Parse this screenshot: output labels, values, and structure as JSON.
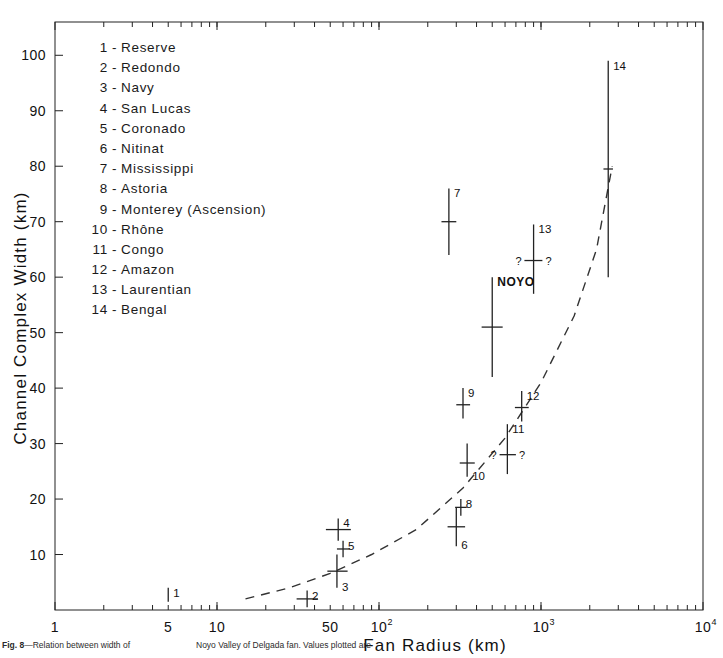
{
  "chart_data": {
    "type": "scatter",
    "xlabel": "Fan  Radius  (km)",
    "ylabel": "Channel  Complex  Width (km)",
    "xscale": "log",
    "yscale": "linear",
    "xlim": [
      1,
      10000
    ],
    "ylim": [
      0,
      106
    ],
    "grid": false,
    "legend_position": "upper-left-inside",
    "xticks_labeled": [
      {
        "value": 1,
        "label": "1"
      },
      {
        "value": 5,
        "label": "5"
      },
      {
        "value": 10,
        "label": "10"
      },
      {
        "value": 50,
        "label": "50"
      },
      {
        "value": 100,
        "label": "10",
        "sup": "2"
      },
      {
        "value": 1000,
        "label": "10",
        "sup": "3"
      },
      {
        "value": 10000,
        "label": "10",
        "sup": "4"
      }
    ],
    "yticks_labeled": [
      10,
      20,
      30,
      40,
      50,
      60,
      70,
      80,
      90,
      100
    ],
    "points": [
      {
        "id": "1",
        "name": "Reserve",
        "x": 5,
        "y": 1.5,
        "ylow": 1.5,
        "yhigh": 4.0,
        "xlow": 5,
        "xhigh": 5,
        "label": "1",
        "label_pos": "top"
      },
      {
        "id": "2",
        "name": "Redondo",
        "x": 36,
        "y": 2.0,
        "ylow": 0.5,
        "yhigh": 3.5,
        "xlow": 31,
        "xhigh": 42,
        "label": "2",
        "label_pos": "top-right"
      },
      {
        "id": "3",
        "name": "Navy",
        "x": 55,
        "y": 7.0,
        "ylow": 4.0,
        "yhigh": 10.0,
        "xlow": 48,
        "xhigh": 64,
        "label": "3",
        "label_pos": "bottom-right"
      },
      {
        "id": "4",
        "name": "San Lucas",
        "x": 56,
        "y": 14.5,
        "ylow": 12.5,
        "yhigh": 16.5,
        "xlow": 47,
        "xhigh": 67,
        "label": "4",
        "label_pos": "top-right"
      },
      {
        "id": "5",
        "name": "Coronado",
        "x": 60,
        "y": 11.0,
        "ylow": 9.5,
        "yhigh": 12.5,
        "xlow": 55,
        "xhigh": 66,
        "label": "5",
        "label_pos": "top-right"
      },
      {
        "id": "6",
        "name": "Nitinat",
        "x": 300,
        "y": 15.0,
        "ylow": 11.5,
        "yhigh": 18.5,
        "xlow": 265,
        "xhigh": 340,
        "label": "6",
        "label_pos": "bottom-right"
      },
      {
        "id": "7",
        "name": "Mississippi",
        "x": 270,
        "y": 70.0,
        "ylow": 64.0,
        "yhigh": 76.0,
        "xlow": 243,
        "xhigh": 300,
        "label": "7",
        "label_pos": "top-right"
      },
      {
        "id": "8",
        "name": "Astoria",
        "x": 320,
        "y": 18.5,
        "ylow": 17.0,
        "yhigh": 20.0,
        "xlow": 295,
        "xhigh": 348,
        "label": "8",
        "label_pos": "top-right"
      },
      {
        "id": "9",
        "name": "Monterey (Ascension)",
        "x": 330,
        "y": 37.0,
        "ylow": 34.5,
        "yhigh": 40.0,
        "xlow": 300,
        "xhigh": 365,
        "label": "9",
        "label_pos": "top-right"
      },
      {
        "id": "10",
        "name": "Rhône",
        "x": 350,
        "y": 26.5,
        "ylow": 24.0,
        "yhigh": 30.0,
        "xlow": 315,
        "xhigh": 390,
        "label": "10",
        "label_pos": "bottom-right"
      },
      {
        "id": "11",
        "name": "Congo",
        "x": 620,
        "y": 28.0,
        "ylow": 24.5,
        "yhigh": 33.5,
        "xlow": 555,
        "xhigh": 700,
        "label": "11",
        "label_pos": "top-right",
        "xquery": true
      },
      {
        "id": "12",
        "name": "Amazon",
        "x": 760,
        "y": 36.5,
        "ylow": 34.0,
        "yhigh": 39.5,
        "xlow": 690,
        "xhigh": 840,
        "label": "12",
        "label_pos": "top-right"
      },
      {
        "id": "13",
        "name": "Laurentian",
        "x": 900,
        "y": 63.0,
        "ylow": 57.0,
        "yhigh": 69.5,
        "xlow": 790,
        "xhigh": 1020,
        "label": "13",
        "label_pos": "top-right",
        "xquery": true
      },
      {
        "id": "14",
        "name": "Bengal",
        "x": 2600,
        "y": 79.5,
        "ylow": 60.0,
        "yhigh": 99.0,
        "xlow": 2430,
        "xhigh": 2780,
        "label": "14",
        "label_pos": "top-right"
      }
    ],
    "special_points": [
      {
        "id": "NOYO",
        "name": "NOYO",
        "x": 500,
        "y": 51.0,
        "ylow": 42.0,
        "yhigh": 60.0,
        "xlow": 430,
        "xhigh": 580,
        "label": "NOYO",
        "label_pos": "top-right"
      }
    ],
    "trend_line": {
      "style": "dashed",
      "description": "dashed best-fit curve rising from lower-left to upper-right",
      "points": [
        {
          "x": 15,
          "y": 2.0
        },
        {
          "x": 28,
          "y": 4.0
        },
        {
          "x": 50,
          "y": 6.6
        },
        {
          "x": 90,
          "y": 10.0
        },
        {
          "x": 170,
          "y": 14.5
        },
        {
          "x": 330,
          "y": 22.0
        },
        {
          "x": 600,
          "y": 31.0
        },
        {
          "x": 1000,
          "y": 41.0
        },
        {
          "x": 1600,
          "y": 53.0
        },
        {
          "x": 2200,
          "y": 65.0
        },
        {
          "x": 2750,
          "y": 80.0
        }
      ]
    }
  },
  "legend": {
    "items": [
      {
        "num": "1",
        "dash": "-",
        "name": "Reserve"
      },
      {
        "num": "2",
        "dash": "-",
        "name": "Redondo"
      },
      {
        "num": "3",
        "dash": "-",
        "name": "Navy"
      },
      {
        "num": "4",
        "dash": "-",
        "name": "San Lucas"
      },
      {
        "num": "5",
        "dash": "-",
        "name": "Coronado"
      },
      {
        "num": "6",
        "dash": "-",
        "name": "Nitinat"
      },
      {
        "num": "7",
        "dash": "-",
        "name": "Mississippi"
      },
      {
        "num": "8",
        "dash": "-",
        "name": "Astoria"
      },
      {
        "num": "9",
        "dash": "-",
        "name": "Monterey (Ascension)"
      },
      {
        "num": "10",
        "dash": "-",
        "name": "Rhône"
      },
      {
        "num": "11",
        "dash": "-",
        "name": "Congo"
      },
      {
        "num": "12",
        "dash": "-",
        "name": "Amazon"
      },
      {
        "num": "13",
        "dash": "-",
        "name": "Laurentian"
      },
      {
        "num": "14",
        "dash": "-",
        "name": "Bengal"
      }
    ]
  },
  "caption": {
    "figure_number": "Fig. 8",
    "text_left": "—Relation between width of",
    "text_mid": "Noyo Valley of Delgada fan. Values plotted are"
  },
  "axes": {
    "x_title": "Fan  Radius  (km)",
    "y_title": "Channel  Complex  Width (km)"
  }
}
